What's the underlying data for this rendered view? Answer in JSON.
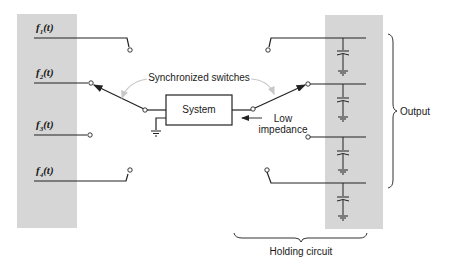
{
  "diagram": {
    "inputs": [
      {
        "func": "f",
        "sub": "1",
        "arg": "(t)"
      },
      {
        "func": "f",
        "sub": "2",
        "arg": "(t)"
      },
      {
        "func": "f",
        "sub": "3",
        "arg": "(t)"
      },
      {
        "func": "f",
        "sub": "4",
        "arg": "(t)"
      }
    ],
    "system_label": "System",
    "switches_label": "Synchronized switches",
    "low_impedance_label_line1": "Low",
    "low_impedance_label_line2": "impedance",
    "output_label": "Output",
    "holding_circuit_label": "Holding circuit",
    "colors": {
      "panel": "#d6d6d6",
      "wire": "#222222",
      "arc": "#c8c8c8"
    }
  }
}
